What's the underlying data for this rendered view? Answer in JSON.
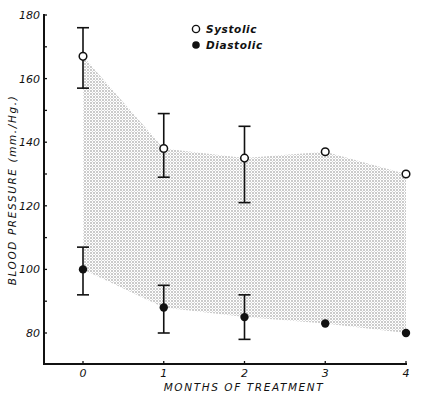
{
  "chart_data": {
    "type": "line",
    "title": "",
    "xlabel": "MONTHS OF TREATMENT",
    "ylabel": "BLOOD PRESSURE (mm./Hg.)",
    "x": [
      0,
      1,
      2,
      3,
      4
    ],
    "x_tick_labels": [
      "0",
      "1",
      "2",
      "3",
      "4"
    ],
    "y_tick_labels": [
      "80",
      "100",
      "120",
      "140",
      "160",
      "180"
    ],
    "y_ticks": [
      80,
      100,
      120,
      140,
      160,
      180
    ],
    "y_minor_step": 10,
    "xlim": [
      -0.5,
      4
    ],
    "ylim": [
      70,
      180
    ],
    "grid": false,
    "legend_position": "upper center",
    "shaded_band": "region between systolic and diastolic means, dotted stipple fill",
    "series": [
      {
        "name": "Systolic",
        "marker": "open-circle",
        "values": [
          167,
          138,
          135,
          137,
          130
        ],
        "error_low": [
          157,
          129,
          121,
          null,
          null
        ],
        "error_high": [
          176,
          149,
          145,
          null,
          null
        ]
      },
      {
        "name": "Diastolic",
        "marker": "filled-circle",
        "values": [
          100,
          88,
          85,
          83,
          80
        ],
        "error_low": [
          92,
          80,
          78,
          null,
          null
        ],
        "error_high": [
          107,
          95,
          92,
          null,
          null
        ]
      }
    ]
  },
  "legend": {
    "items": [
      {
        "label": "Systolic",
        "marker": "open-circle"
      },
      {
        "label": "Diastolic",
        "marker": "filled-circle"
      }
    ]
  },
  "colors": {
    "ink": "#111111",
    "background": "#ffffff",
    "stipple": "#8a8a8a"
  }
}
